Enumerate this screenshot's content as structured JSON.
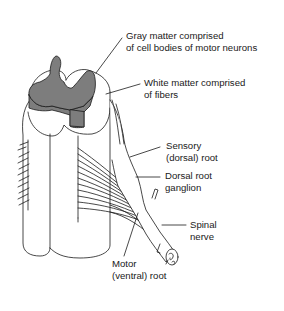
{
  "diagram": {
    "colors": {
      "background": "#ffffff",
      "line": "#1a1a1a",
      "gray_matter": "#7d7d7d",
      "white_matter": "#ffffff"
    },
    "labels": {
      "gray_matter": {
        "line1": "Gray matter comprised",
        "line2": "of cell bodies of motor neurons"
      },
      "white_matter": {
        "line1": "White matter comprised",
        "line2": "of fibers"
      },
      "sensory_root": {
        "line1": "Sensory",
        "line2": "(dorsal) root"
      },
      "dorsal_root_ganglion": {
        "line1": "Dorsal root",
        "line2": "ganglion"
      },
      "spinal_nerve": {
        "line1": "Spinal",
        "line2": "nerve"
      },
      "motor_root": {
        "line1": "Motor",
        "line2": "(ventral) root"
      }
    }
  }
}
